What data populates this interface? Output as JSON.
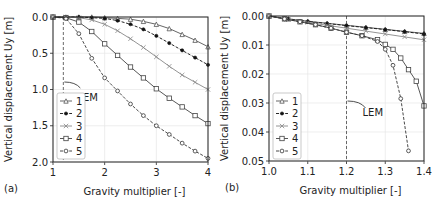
{
  "chart_data": [
    {
      "type": "line",
      "panel_label": "(a)",
      "xlabel": "Gravity multiplier [-]",
      "ylabel": "Vertical displacement Uy [m]",
      "xlim": [
        1,
        4
      ],
      "ylim": [
        0.0,
        2.0
      ],
      "y_inverted": true,
      "xticks": [
        "1",
        "2",
        "3",
        "4"
      ],
      "yticks": [
        "0.0",
        "0.5",
        "1.0",
        "1.5",
        "2.0"
      ],
      "grid": true,
      "legend_position": "lower left",
      "annotation": {
        "text": "LEM",
        "x": 1.2
      },
      "series": [
        {
          "name": "1",
          "marker": "triangle",
          "dash": "solid",
          "x": [
            1.0,
            1.25,
            1.5,
            1.75,
            2.0,
            2.25,
            2.5,
            2.75,
            3.0,
            3.25,
            3.5,
            3.75,
            4.0
          ],
          "y": [
            0.0,
            0.0,
            0.0,
            0.0,
            0.01,
            0.02,
            0.03,
            0.06,
            0.1,
            0.16,
            0.24,
            0.32,
            0.41
          ]
        },
        {
          "name": "2",
          "marker": "filled-circle",
          "dash": "dashed",
          "x": [
            1.0,
            1.25,
            1.5,
            1.75,
            2.0,
            2.25,
            2.5,
            2.75,
            3.0,
            3.25,
            3.5,
            3.75,
            4.0
          ],
          "y": [
            0.0,
            0.0,
            0.0,
            0.01,
            0.02,
            0.05,
            0.1,
            0.17,
            0.26,
            0.36,
            0.46,
            0.56,
            0.66
          ]
        },
        {
          "name": "3",
          "marker": "x",
          "dash": "solid",
          "x": [
            1.0,
            1.25,
            1.5,
            1.75,
            2.0,
            2.25,
            2.5,
            2.75,
            3.0,
            3.25,
            3.5,
            3.75,
            4.0
          ],
          "y": [
            0.0,
            0.0,
            0.01,
            0.04,
            0.1,
            0.19,
            0.3,
            0.42,
            0.55,
            0.68,
            0.8,
            0.9,
            1.0
          ]
        },
        {
          "name": "4",
          "marker": "square",
          "dash": "solid",
          "x": [
            1.0,
            1.25,
            1.5,
            1.75,
            2.0,
            2.25,
            2.5,
            2.75,
            3.0,
            3.25,
            3.5,
            3.75,
            4.0
          ],
          "y": [
            0.0,
            0.01,
            0.07,
            0.2,
            0.37,
            0.53,
            0.69,
            0.84,
            0.99,
            1.12,
            1.24,
            1.36,
            1.47
          ]
        },
        {
          "name": "5",
          "marker": "open-circle",
          "dash": "dashed",
          "x": [
            1.0,
            1.25,
            1.5,
            1.75,
            2.0,
            2.25,
            2.5,
            2.75,
            3.0,
            3.25,
            3.5,
            3.75,
            4.0
          ],
          "y": [
            0.0,
            0.02,
            0.23,
            0.57,
            0.84,
            1.02,
            1.2,
            1.36,
            1.5,
            1.62,
            1.74,
            1.85,
            1.95
          ]
        }
      ]
    },
    {
      "type": "line",
      "panel_label": "(b)",
      "xlabel": "Gravity multiplier [-]",
      "ylabel": "Vertical displacement Uy [m]",
      "xlim": [
        1.0,
        1.4
      ],
      "ylim": [
        0.0,
        0.05
      ],
      "y_inverted": true,
      "xticks": [
        "1.0",
        "1.1",
        "1.2",
        "1.3",
        "1.4"
      ],
      "yticks": [
        "0.00",
        "0.01",
        "0.02",
        "0.03",
        "0.04",
        "0.05"
      ],
      "grid": true,
      "legend_position": "lower left",
      "annotation": {
        "text": "LEM",
        "x": 1.2
      },
      "series": [
        {
          "name": "1",
          "marker": "triangle",
          "dash": "solid",
          "x": [
            1.0,
            1.05,
            1.1,
            1.15,
            1.2,
            1.25,
            1.3,
            1.35,
            1.4
          ],
          "y": [
            0.0,
            0.001,
            0.0018,
            0.0025,
            0.0032,
            0.0039,
            0.0046,
            0.0053,
            0.006
          ]
        },
        {
          "name": "2",
          "marker": "filled-circle",
          "dash": "dashed",
          "x": [
            1.0,
            1.05,
            1.1,
            1.15,
            1.2,
            1.25,
            1.3,
            1.35,
            1.4
          ],
          "y": [
            0.0,
            0.001,
            0.0019,
            0.0026,
            0.0033,
            0.004,
            0.0047,
            0.0054,
            0.0062
          ]
        },
        {
          "name": "3",
          "marker": "x",
          "dash": "solid",
          "x": [
            1.0,
            1.05,
            1.1,
            1.15,
            1.2,
            1.25,
            1.3,
            1.35,
            1.4
          ],
          "y": [
            0.0,
            0.0012,
            0.0022,
            0.0032,
            0.0042,
            0.0052,
            0.0062,
            0.0072,
            0.0082
          ]
        },
        {
          "name": "4",
          "marker": "square",
          "dash": "solid",
          "x": [
            1.0,
            1.04,
            1.08,
            1.12,
            1.16,
            1.2,
            1.24,
            1.28,
            1.3,
            1.32,
            1.34,
            1.36,
            1.38,
            1.4
          ],
          "y": [
            0.0,
            0.001,
            0.002,
            0.003,
            0.0042,
            0.0056,
            0.0068,
            0.0082,
            0.0098,
            0.0115,
            0.0145,
            0.0185,
            0.0225,
            0.031
          ]
        },
        {
          "name": "5",
          "marker": "open-circle",
          "dash": "dashed",
          "x": [
            1.0,
            1.04,
            1.08,
            1.12,
            1.16,
            1.2,
            1.24,
            1.28,
            1.3,
            1.32,
            1.34,
            1.36
          ],
          "y": [
            0.0,
            0.001,
            0.002,
            0.003,
            0.0042,
            0.0056,
            0.0068,
            0.0088,
            0.0115,
            0.017,
            0.0285,
            0.0465
          ]
        }
      ]
    }
  ]
}
